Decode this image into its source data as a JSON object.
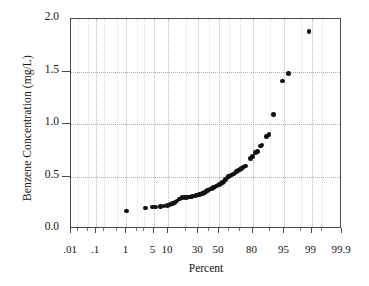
{
  "chart_data": {
    "type": "scatter",
    "title": "",
    "subtitle": "",
    "xlabel": "Percent",
    "ylabel": "Benzene Concentration (mg/L)",
    "plot_kind": "normal probability plot",
    "grid": true,
    "legend": null,
    "marker": {
      "shape": "circle",
      "color": "#111111",
      "size_px": 4.6
    },
    "ylim": [
      0.0,
      2.0
    ],
    "yticks": [
      0.0,
      0.5,
      1.0,
      1.5,
      2.0
    ],
    "ytick_labels": [
      "0.0",
      "0.5",
      "1.0",
      "1.5",
      "2.0"
    ],
    "xlim_percent": [
      0.01,
      99.9
    ],
    "xticks": [
      0.01,
      0.1,
      1,
      5,
      10,
      30,
      50,
      80,
      95,
      99,
      99.9
    ],
    "xtick_labels": [
      ".01",
      ".1",
      "1",
      "5",
      "10",
      "30",
      "50",
      "80",
      "95",
      "99",
      "99.9"
    ],
    "x_minor_ticks": [
      0.02,
      0.05,
      0.2,
      0.5,
      2,
      3,
      20,
      40,
      60,
      70,
      90,
      98,
      99.5
    ],
    "x_unit": "percent",
    "y_unit": "mg/L",
    "annotations": [],
    "points": [
      {
        "percent": 1.0,
        "value": 0.17
      },
      {
        "percent": 3.2,
        "value": 0.2
      },
      {
        "percent": 4.8,
        "value": 0.21
      },
      {
        "percent": 5.6,
        "value": 0.21
      },
      {
        "percent": 7.0,
        "value": 0.215
      },
      {
        "percent": 8.4,
        "value": 0.22
      },
      {
        "percent": 9.8,
        "value": 0.225
      },
      {
        "percent": 11.0,
        "value": 0.235
      },
      {
        "percent": 12.2,
        "value": 0.245
      },
      {
        "percent": 13.4,
        "value": 0.255
      },
      {
        "percent": 14.6,
        "value": 0.265
      },
      {
        "percent": 16.0,
        "value": 0.285
      },
      {
        "percent": 17.5,
        "value": 0.3
      },
      {
        "percent": 19.0,
        "value": 0.3
      },
      {
        "percent": 20.5,
        "value": 0.3
      },
      {
        "percent": 22.0,
        "value": 0.305
      },
      {
        "percent": 23.5,
        "value": 0.305
      },
      {
        "percent": 25.0,
        "value": 0.31
      },
      {
        "percent": 26.5,
        "value": 0.315
      },
      {
        "percent": 28.0,
        "value": 0.32
      },
      {
        "percent": 29.5,
        "value": 0.325
      },
      {
        "percent": 31.0,
        "value": 0.33
      },
      {
        "percent": 32.5,
        "value": 0.335
      },
      {
        "percent": 34.0,
        "value": 0.34
      },
      {
        "percent": 35.5,
        "value": 0.35
      },
      {
        "percent": 37.0,
        "value": 0.355
      },
      {
        "percent": 38.5,
        "value": 0.365
      },
      {
        "percent": 40.0,
        "value": 0.37
      },
      {
        "percent": 41.5,
        "value": 0.38
      },
      {
        "percent": 43.0,
        "value": 0.385
      },
      {
        "percent": 44.5,
        "value": 0.395
      },
      {
        "percent": 46.0,
        "value": 0.4
      },
      {
        "percent": 47.5,
        "value": 0.41
      },
      {
        "percent": 49.0,
        "value": 0.42
      },
      {
        "percent": 50.5,
        "value": 0.425
      },
      {
        "percent": 52.0,
        "value": 0.435
      },
      {
        "percent": 53.5,
        "value": 0.445
      },
      {
        "percent": 55.0,
        "value": 0.455
      },
      {
        "percent": 56.5,
        "value": 0.47
      },
      {
        "percent": 58.0,
        "value": 0.485
      },
      {
        "percent": 59.5,
        "value": 0.5
      },
      {
        "percent": 61.0,
        "value": 0.505
      },
      {
        "percent": 62.5,
        "value": 0.515
      },
      {
        "percent": 64.0,
        "value": 0.525
      },
      {
        "percent": 65.5,
        "value": 0.535
      },
      {
        "percent": 67.0,
        "value": 0.545
      },
      {
        "percent": 68.5,
        "value": 0.555
      },
      {
        "percent": 70.0,
        "value": 0.565
      },
      {
        "percent": 71.5,
        "value": 0.575
      },
      {
        "percent": 73.0,
        "value": 0.59
      },
      {
        "percent": 74.5,
        "value": 0.6
      },
      {
        "percent": 78.5,
        "value": 0.67
      },
      {
        "percent": 80.0,
        "value": 0.69
      },
      {
        "percent": 82.0,
        "value": 0.73
      },
      {
        "percent": 83.5,
        "value": 0.74
      },
      {
        "percent": 85.0,
        "value": 0.79
      },
      {
        "percent": 86.0,
        "value": 0.8
      },
      {
        "percent": 88.5,
        "value": 0.88
      },
      {
        "percent": 89.5,
        "value": 0.9
      },
      {
        "percent": 91.5,
        "value": 1.09
      },
      {
        "percent": 94.5,
        "value": 1.41
      },
      {
        "percent": 96.0,
        "value": 1.48
      },
      {
        "percent": 98.8,
        "value": 1.88
      }
    ]
  },
  "axes": {
    "y_title": "Benzene Concentration (mg/L)",
    "x_title": "Percent"
  }
}
